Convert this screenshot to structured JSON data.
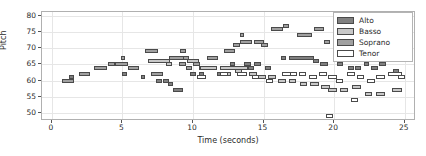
{
  "chart_data": {
    "type": "bar",
    "title": "",
    "xlabel": "Time (seconds)",
    "ylabel": "Pitch",
    "xlim": [
      -0.7,
      25.8
    ],
    "ylim": [
      47.5,
      81.2
    ],
    "xticks": [
      0,
      5,
      10,
      15,
      20,
      25
    ],
    "yticks": [
      50,
      55,
      60,
      65,
      70,
      75,
      80
    ],
    "grid": true,
    "legend_position": "upper right",
    "legend": [
      {
        "name": "Alto",
        "color": "#808080"
      },
      {
        "name": "Basso",
        "color": "#c8c8c8"
      },
      {
        "name": "Soprano",
        "color": "#a0a0a0"
      },
      {
        "name": "Tenor",
        "color": "#ffffff"
      }
    ],
    "note_height": 1.2,
    "series": [
      {
        "name": "Soprano",
        "color": "#a0a0a0",
        "notes": [
          {
            "t": 0.7,
            "dur": 0.9,
            "pitch": 60
          },
          {
            "t": 1.9,
            "dur": 0.8,
            "pitch": 62
          },
          {
            "t": 3.0,
            "dur": 0.9,
            "pitch": 64
          },
          {
            "t": 4.0,
            "dur": 0.5,
            "pitch": 65
          },
          {
            "t": 4.5,
            "dur": 0.9,
            "pitch": 65
          },
          {
            "t": 4.9,
            "dur": 0.3,
            "pitch": 67
          },
          {
            "t": 5.4,
            "dur": 0.8,
            "pitch": 64
          },
          {
            "t": 6.6,
            "dur": 0.9,
            "pitch": 69
          },
          {
            "t": 7.0,
            "dur": 0.9,
            "pitch": 62
          },
          {
            "t": 8.3,
            "dur": 1.1,
            "pitch": 67
          },
          {
            "t": 9.1,
            "dur": 0.4,
            "pitch": 69
          },
          {
            "t": 9.3,
            "dur": 0.4,
            "pitch": 67
          },
          {
            "t": 9.0,
            "dur": 0.5,
            "pitch": 65
          },
          {
            "t": 9.5,
            "dur": 0.4,
            "pitch": 64
          },
          {
            "t": 10.0,
            "dur": 0.5,
            "pitch": 65
          },
          {
            "t": 10.4,
            "dur": 0.4,
            "pitch": 64
          },
          {
            "t": 11.0,
            "dur": 0.8,
            "pitch": 67
          },
          {
            "t": 12.2,
            "dur": 0.8,
            "pitch": 69
          },
          {
            "t": 12.8,
            "dur": 0.5,
            "pitch": 71
          },
          {
            "t": 13.3,
            "dur": 0.9,
            "pitch": 72
          },
          {
            "t": 13.3,
            "dur": 0.3,
            "pitch": 74
          },
          {
            "t": 14.3,
            "dur": 0.7,
            "pitch": 72
          },
          {
            "t": 14.8,
            "dur": 0.5,
            "pitch": 71
          },
          {
            "t": 15.5,
            "dur": 0.9,
            "pitch": 76
          },
          {
            "t": 16.4,
            "dur": 0.4,
            "pitch": 77
          },
          {
            "t": 17.4,
            "dur": 1.0,
            "pitch": 74
          },
          {
            "t": 18.6,
            "dur": 0.7,
            "pitch": 76
          },
          {
            "t": 19.3,
            "dur": 0.4,
            "pitch": 72
          },
          {
            "t": 20.1,
            "dur": 0.4,
            "pitch": 71
          },
          {
            "t": 20.9,
            "dur": 0.5,
            "pitch": 69
          },
          {
            "t": 22.0,
            "dur": 0.8,
            "pitch": 69
          },
          {
            "t": 23.0,
            "dur": 0.5,
            "pitch": 67
          },
          {
            "t": 24.0,
            "dur": 0.9,
            "pitch": 67
          }
        ]
      },
      {
        "name": "Alto",
        "color": "#808080",
        "notes": [
          {
            "t": 1.2,
            "dur": 0.4,
            "pitch": 61
          },
          {
            "t": 5.0,
            "dur": 0.3,
            "pitch": 62
          },
          {
            "t": 6.3,
            "dur": 0.3,
            "pitch": 61
          },
          {
            "t": 7.4,
            "dur": 0.4,
            "pitch": 60
          },
          {
            "t": 7.9,
            "dur": 0.4,
            "pitch": 60
          },
          {
            "t": 8.2,
            "dur": 0.4,
            "pitch": 59
          },
          {
            "t": 8.6,
            "dur": 0.7,
            "pitch": 57
          },
          {
            "t": 9.8,
            "dur": 0.4,
            "pitch": 62
          },
          {
            "t": 10.4,
            "dur": 0.4,
            "pitch": 62
          },
          {
            "t": 11.1,
            "dur": 0.4,
            "pitch": 64
          },
          {
            "t": 11.7,
            "dur": 0.4,
            "pitch": 62
          },
          {
            "t": 12.4,
            "dur": 0.5,
            "pitch": 64
          },
          {
            "t": 12.6,
            "dur": 0.4,
            "pitch": 65
          },
          {
            "t": 13.1,
            "dur": 0.5,
            "pitch": 64
          },
          {
            "t": 13.6,
            "dur": 0.5,
            "pitch": 65
          },
          {
            "t": 13.9,
            "dur": 0.4,
            "pitch": 64
          },
          {
            "t": 14.3,
            "dur": 0.5,
            "pitch": 65
          },
          {
            "t": 15.1,
            "dur": 0.4,
            "pitch": 64
          },
          {
            "t": 16.2,
            "dur": 0.4,
            "pitch": 67
          },
          {
            "t": 16.8,
            "dur": 1.8,
            "pitch": 67
          },
          {
            "t": 18.5,
            "dur": 0.4,
            "pitch": 66
          },
          {
            "t": 19.0,
            "dur": 0.6,
            "pitch": 65
          },
          {
            "t": 20.2,
            "dur": 0.4,
            "pitch": 65
          },
          {
            "t": 21.0,
            "dur": 0.4,
            "pitch": 64
          },
          {
            "t": 21.5,
            "dur": 0.4,
            "pitch": 64
          },
          {
            "t": 22.1,
            "dur": 0.4,
            "pitch": 65
          },
          {
            "t": 22.6,
            "dur": 0.5,
            "pitch": 64
          },
          {
            "t": 23.2,
            "dur": 0.5,
            "pitch": 65
          },
          {
            "t": 24.2,
            "dur": 0.4,
            "pitch": 63
          }
        ]
      },
      {
        "name": "Basso",
        "color": "#c8c8c8",
        "notes": [
          {
            "t": 6.8,
            "dur": 1.6,
            "pitch": 66
          },
          {
            "t": 8.1,
            "dur": 0.4,
            "pitch": 65
          },
          {
            "t": 9.6,
            "dur": 0.8,
            "pitch": 66
          },
          {
            "t": 10.5,
            "dur": 1.2,
            "pitch": 64
          },
          {
            "t": 11.9,
            "dur": 2.0,
            "pitch": 64
          },
          {
            "t": 12.2,
            "dur": 0.5,
            "pitch": 62
          },
          {
            "t": 13.0,
            "dur": 0.5,
            "pitch": 63
          },
          {
            "t": 14.0,
            "dur": 0.5,
            "pitch": 62
          },
          {
            "t": 14.6,
            "dur": 0.6,
            "pitch": 61
          },
          {
            "t": 15.3,
            "dur": 0.6,
            "pitch": 61
          },
          {
            "t": 16.0,
            "dur": 0.6,
            "pitch": 60
          },
          {
            "t": 16.8,
            "dur": 0.5,
            "pitch": 60
          },
          {
            "t": 17.6,
            "dur": 0.5,
            "pitch": 59
          },
          {
            "t": 18.3,
            "dur": 0.6,
            "pitch": 59
          },
          {
            "t": 19.1,
            "dur": 0.6,
            "pitch": 58
          },
          {
            "t": 19.6,
            "dur": 0.6,
            "pitch": 57
          },
          {
            "t": 20.4,
            "dur": 0.6,
            "pitch": 57
          },
          {
            "t": 21.3,
            "dur": 0.6,
            "pitch": 58
          },
          {
            "t": 22.2,
            "dur": 0.5,
            "pitch": 56
          },
          {
            "t": 23.0,
            "dur": 0.6,
            "pitch": 56
          },
          {
            "t": 24.1,
            "dur": 0.7,
            "pitch": 57
          },
          {
            "t": 24.3,
            "dur": 0.4,
            "pitch": 62
          }
        ]
      },
      {
        "name": "Tenor",
        "color": "#ffffff",
        "notes": [
          {
            "t": 10.3,
            "dur": 0.6,
            "pitch": 61
          },
          {
            "t": 11.9,
            "dur": 0.6,
            "pitch": 62
          },
          {
            "t": 13.1,
            "dur": 0.7,
            "pitch": 62
          },
          {
            "t": 14.2,
            "dur": 0.5,
            "pitch": 61
          },
          {
            "t": 15.2,
            "dur": 0.5,
            "pitch": 60
          },
          {
            "t": 16.3,
            "dur": 0.7,
            "pitch": 62
          },
          {
            "t": 16.9,
            "dur": 0.5,
            "pitch": 62
          },
          {
            "t": 17.5,
            "dur": 0.5,
            "pitch": 62
          },
          {
            "t": 18.2,
            "dur": 0.6,
            "pitch": 61
          },
          {
            "t": 18.9,
            "dur": 0.6,
            "pitch": 62
          },
          {
            "t": 19.6,
            "dur": 0.6,
            "pitch": 61
          },
          {
            "t": 20.1,
            "dur": 0.5,
            "pitch": 60
          },
          {
            "t": 20.9,
            "dur": 0.6,
            "pitch": 62
          },
          {
            "t": 21.6,
            "dur": 0.5,
            "pitch": 61
          },
          {
            "t": 22.3,
            "dur": 0.6,
            "pitch": 60
          },
          {
            "t": 23.0,
            "dur": 0.6,
            "pitch": 61
          },
          {
            "t": 23.8,
            "dur": 1.0,
            "pitch": 62
          },
          {
            "t": 24.5,
            "dur": 0.5,
            "pitch": 61
          },
          {
            "t": 21.2,
            "dur": 0.5,
            "pitch": 54
          },
          {
            "t": 19.4,
            "dur": 0.5,
            "pitch": 49
          }
        ]
      }
    ]
  }
}
